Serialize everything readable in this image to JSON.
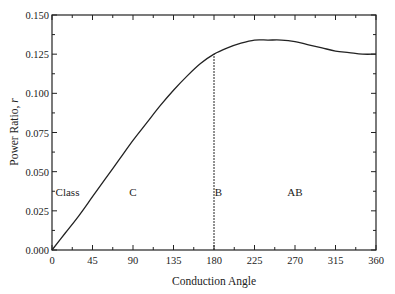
{
  "chart_data": {
    "type": "line",
    "title": "",
    "xlabel": "Conduction Angle",
    "ylabel": "Power Ratio, r",
    "xlim": [
      0,
      360
    ],
    "ylim": [
      0,
      0.15
    ],
    "xticks": [
      0,
      45,
      90,
      135,
      180,
      225,
      270,
      315,
      360
    ],
    "yticks": [
      "0.000",
      "0.025",
      "0.050",
      "0.075",
      "0.100",
      "0.125",
      "0.150"
    ],
    "grid": false,
    "series": [
      {
        "name": "Power Ratio",
        "x": [
          0,
          15,
          30,
          45,
          60,
          75,
          90,
          105,
          120,
          135,
          150,
          165,
          180,
          195,
          210,
          225,
          240,
          255,
          270,
          285,
          300,
          315,
          330,
          345,
          360
        ],
        "y": [
          0.0,
          0.011,
          0.022,
          0.034,
          0.046,
          0.058,
          0.07,
          0.081,
          0.092,
          0.102,
          0.111,
          0.119,
          0.125,
          0.129,
          0.132,
          0.134,
          0.134,
          0.134,
          0.133,
          0.131,
          0.129,
          0.127,
          0.126,
          0.125,
          0.125
        ]
      }
    ],
    "annotations": [
      {
        "text": "Class",
        "x": 4,
        "y": 0.037
      },
      {
        "text": "C",
        "x": 90,
        "y": 0.037
      },
      {
        "text": "B",
        "x": 185,
        "y": 0.037
      },
      {
        "text": "AB",
        "x": 270,
        "y": 0.037
      }
    ],
    "vline": {
      "x": 180,
      "style": "dashed"
    }
  }
}
